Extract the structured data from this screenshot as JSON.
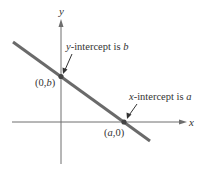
{
  "diagram": {
    "axes": {
      "x_label": "x",
      "y_label": "y"
    },
    "points": [
      {
        "id": "y-intercept",
        "label_prefix": "(0,",
        "label_var": "b",
        "label_suffix": ")"
      },
      {
        "id": "x-intercept",
        "label_prefix": "(",
        "label_var": "a",
        "label_suffix": ",0)"
      }
    ],
    "annotations": [
      {
        "id": "y-intercept-note",
        "prefix_var": "y",
        "text": "-intercept is ",
        "var": "b"
      },
      {
        "id": "x-intercept-note",
        "prefix_var": "x",
        "text": "-intercept is ",
        "var": "a"
      }
    ],
    "colors": {
      "axis": "#666666",
      "line": "#6a6a6a",
      "point": "#444444",
      "text": "#333333"
    }
  }
}
